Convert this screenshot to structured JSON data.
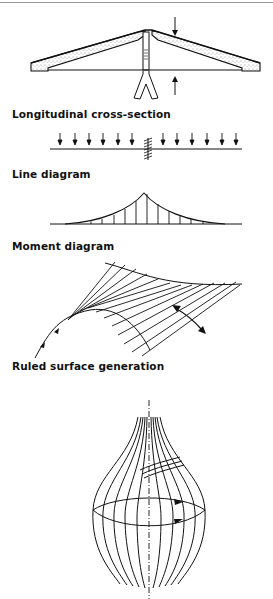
{
  "figure": {
    "captions": {
      "section": "Longitudinal cross-section",
      "line": "Line diagram",
      "moment": "Moment diagram",
      "ruled": "Ruled surface generation"
    },
    "panels": [
      {
        "id": "cross-section",
        "description": "Roof shell section with central column support and load arrows"
      },
      {
        "id": "line-diagram",
        "description": "Beam with uniform distributed downward loads and central fixed support",
        "arrows_left": 6,
        "arrows_right": 6
      },
      {
        "id": "moment-diagram",
        "description": "Cusp-shaped moment curve peaking at central support with vertical ordinates",
        "ordinates": 13
      },
      {
        "id": "ruled-surface",
        "description": "Hyperbolic saddle generated by straight line rulings with rotation arrow"
      },
      {
        "id": "revolution-surface",
        "description": "Bulb-shaped surface of revolution about vertical axis with rotation arrows"
      }
    ],
    "colors": {
      "ink": "#111111",
      "background": "#ffffff",
      "border": "#9a9a9a"
    }
  }
}
